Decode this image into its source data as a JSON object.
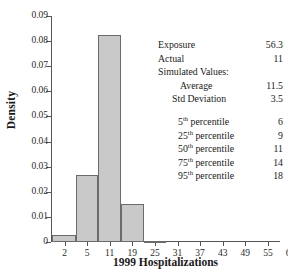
{
  "title_remnant": "·",
  "chart_data": {
    "type": "bar",
    "title": "",
    "xlabel": "1999 Hospitalizations",
    "ylabel": "Density",
    "grid": false,
    "legend_position": "none",
    "ylim": [
      0,
      0.09
    ],
    "ytick_labels": [
      "0",
      "0.01",
      "0.02",
      "0.03",
      "0.04",
      "0.05",
      "0.06",
      "0.07",
      "0.08",
      "0.09"
    ],
    "ytick_values": [
      0,
      0.01,
      0.02,
      0.03,
      0.04,
      0.05,
      0.06,
      0.07,
      0.08,
      0.09
    ],
    "xtick_labels": [
      "2",
      "5",
      "11",
      "19",
      "25",
      "31",
      "37",
      "43",
      "49",
      "55",
      "61"
    ],
    "categories": [
      "2",
      "5",
      "11",
      "19",
      "25"
    ],
    "values": [
      0.0026,
      0.0265,
      0.0826,
      0.0153,
      0.0005
    ],
    "bar_color": "#c9c9c9",
    "bar_edge_color": "#6b6b6b"
  },
  "stats": {
    "exposure": {
      "label": "Exposure",
      "value": "56.3"
    },
    "actual": {
      "label": "Actual",
      "value": "11"
    },
    "simulated_heading": "Simulated Values:",
    "average": {
      "label": "Average",
      "value": "11.5"
    },
    "std_deviation": {
      "label": "Std Deviation",
      "value": "3.5"
    },
    "percentiles": [
      {
        "num": "5",
        "sup": "th",
        "label": "percentile",
        "value": "6"
      },
      {
        "num": "25",
        "sup": "th",
        "label": "percentile",
        "value": "9"
      },
      {
        "num": "50",
        "sup": "th",
        "label": "percentile",
        "value": "11"
      },
      {
        "num": "75",
        "sup": "th",
        "label": "percentile",
        "value": "14"
      },
      {
        "num": "95",
        "sup": "th",
        "label": "percentile",
        "value": "18"
      }
    ]
  }
}
